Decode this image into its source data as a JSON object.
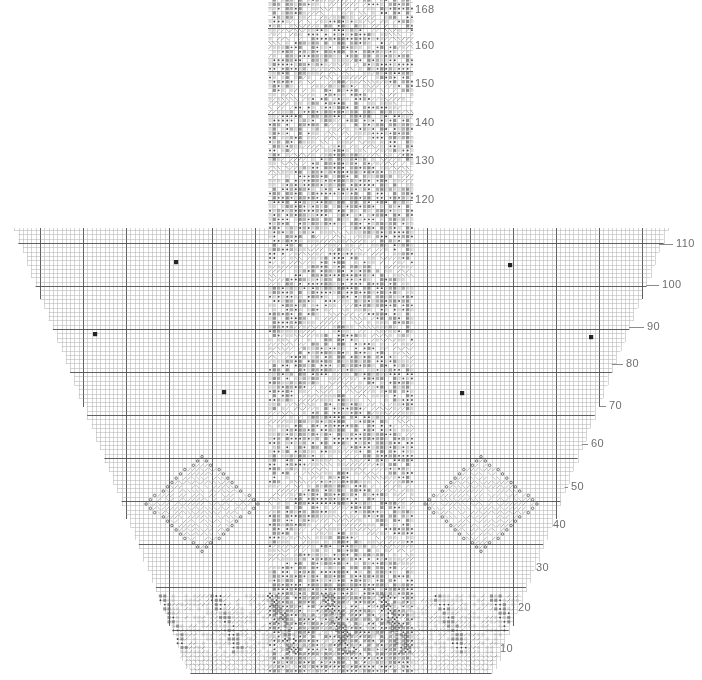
{
  "document": {
    "title": "Knitting Lace Shawl Stitch Chart",
    "kind": "stitch-chart",
    "background_color": "#ffffff",
    "grid_line_color": "#b4b4b4",
    "grid_major_color": "#555555",
    "symbol_color": "#4a4a4a",
    "label_color": "#6e6e6e"
  },
  "chart_data": {
    "type": "heatmap",
    "xlabel": "",
    "ylabel": "Row",
    "grid": true,
    "legend_position": "none",
    "cell_size_px": 4.3,
    "major_every": 10,
    "stitch_columns": 152,
    "stitch_rows": 168,
    "row_axis_side": "right",
    "row_tick_step": 10,
    "row_ticks": [
      10,
      20,
      30,
      40,
      50,
      60,
      70,
      80,
      90,
      100,
      110,
      120,
      130,
      140,
      150,
      160,
      168
    ],
    "row_tick_labels": [
      "10",
      "20",
      "30",
      "40",
      "50",
      "60",
      "70",
      "80",
      "90",
      "100",
      "110",
      "120",
      "130",
      "140",
      "150",
      "160",
      "168"
    ],
    "shape_description": "triangular shawl silhouette widening from a narrow bottom point to a broad top, with a tall narrow center panel continuing above the body",
    "regions": [
      {
        "name": "center-panel",
        "description": "tall narrow vertical panel of dense textured stitches running the full height",
        "x_from_px": 268,
        "x_to_px": 413,
        "y_from_px": 0,
        "y_to_px": 673,
        "fill": "dense-texture"
      },
      {
        "name": "left-wing",
        "description": "plain stockinette ground left of the center panel, stepped diagonal outer edge",
        "fill": "plain-grid"
      },
      {
        "name": "right-wing",
        "description": "plain stockinette ground right of the center panel, stepped diagonal outer edge",
        "fill": "plain-grid"
      }
    ],
    "motifs": [
      {
        "name": "chevron-band",
        "shape": "chevron",
        "center_x_px": 341,
        "center_y_px": 262,
        "width_px": 145,
        "height_px": 58
      },
      {
        "name": "chevron-band",
        "shape": "chevron",
        "center_x_px": 341,
        "center_y_px": 340,
        "width_px": 145,
        "height_px": 58
      },
      {
        "name": "chevron-band",
        "shape": "chevron",
        "center_x_px": 341,
        "center_y_px": 410,
        "width_px": 145,
        "height_px": 58
      },
      {
        "name": "chevron-band",
        "shape": "chevron",
        "center_x_px": 341,
        "center_y_px": 485,
        "width_px": 145,
        "height_px": 58
      },
      {
        "name": "chevron-band",
        "shape": "chevron",
        "center_x_px": 341,
        "center_y_px": 545,
        "width_px": 145,
        "height_px": 58
      },
      {
        "name": "chevron-band",
        "shape": "chevron",
        "center_x_px": 341,
        "center_y_px": 160,
        "width_px": 145,
        "height_px": 58
      },
      {
        "name": "chevron-band",
        "shape": "chevron",
        "center_x_px": 341,
        "center_y_px": 95,
        "width_px": 145,
        "height_px": 58
      },
      {
        "name": "chevron-band",
        "shape": "chevron",
        "center_x_px": 341,
        "center_y_px": 30,
        "width_px": 145,
        "height_px": 58
      },
      {
        "name": "diamond-lace-motif-left",
        "shape": "diamond",
        "center_x_px": 202,
        "center_y_px": 504,
        "half_width_px": 57,
        "half_height_px": 46,
        "outline": "yarn-over-circles"
      },
      {
        "name": "diamond-lace-motif-right",
        "shape": "diamond",
        "center_x_px": 481,
        "center_y_px": 504,
        "half_width_px": 57,
        "half_height_px": 46,
        "outline": "yarn-over-circles"
      },
      {
        "name": "scallop-border-left",
        "shape": "scallop",
        "center_x_px": 225,
        "center_y_px": 630
      },
      {
        "name": "scallop-border-right",
        "shape": "scallop",
        "center_x_px": 455,
        "center_y_px": 630
      }
    ],
    "marked_stitches": [
      {
        "x_px": 176,
        "y_px": 262,
        "symbol": "dark-square"
      },
      {
        "x_px": 95,
        "y_px": 334,
        "symbol": "dark-square"
      },
      {
        "x_px": 224,
        "y_px": 392,
        "symbol": "dark-square"
      },
      {
        "x_px": 510,
        "y_px": 265,
        "symbol": "dark-square"
      },
      {
        "x_px": 591,
        "y_px": 337,
        "symbol": "dark-square"
      },
      {
        "x_px": 462,
        "y_px": 393,
        "symbol": "dark-square"
      }
    ]
  },
  "row_label_positions": [
    {
      "label": "168",
      "x": 415,
      "y": 4
    },
    {
      "label": "160",
      "x": 415,
      "y": 40
    },
    {
      "label": "150",
      "x": 415,
      "y": 78
    },
    {
      "label": "140",
      "x": 415,
      "y": 117
    },
    {
      "label": "130",
      "x": 415,
      "y": 155
    },
    {
      "label": "120",
      "x": 415,
      "y": 194
    },
    {
      "label": "110",
      "x": 676,
      "y": 238
    },
    {
      "label": "100",
      "x": 662,
      "y": 279
    },
    {
      "label": "90",
      "x": 647,
      "y": 321
    },
    {
      "label": "80",
      "x": 626,
      "y": 358
    },
    {
      "label": "70",
      "x": 609,
      "y": 400
    },
    {
      "label": "60",
      "x": 591,
      "y": 438
    },
    {
      "label": "50",
      "x": 571,
      "y": 481
    },
    {
      "label": "40",
      "x": 553,
      "y": 519
    },
    {
      "label": "30",
      "x": 536,
      "y": 562
    },
    {
      "label": "20",
      "x": 518,
      "y": 602
    },
    {
      "label": "10",
      "x": 500,
      "y": 643
    }
  ]
}
